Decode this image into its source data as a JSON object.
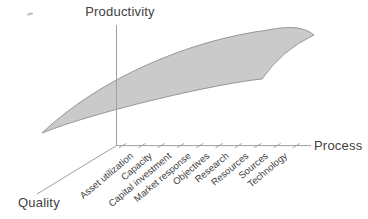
{
  "axes": {
    "vertical": {
      "label": "Productivity"
    },
    "horizontal": {
      "label": "Process"
    },
    "depth": {
      "label": "Quality"
    }
  },
  "process_categories": [
    "Asset utilization",
    "Capacity",
    "Capital investment",
    "Market response",
    "Objectives",
    "Research",
    "Resources",
    "Sources",
    "Technology"
  ],
  "surface": {
    "name": "productivity-surface",
    "fill": "#cacaca",
    "stroke": "#8d8d8d"
  },
  "colors": {
    "axis": "#9f9f9f",
    "text": "#3c3c3c",
    "background": "#ffffff"
  }
}
